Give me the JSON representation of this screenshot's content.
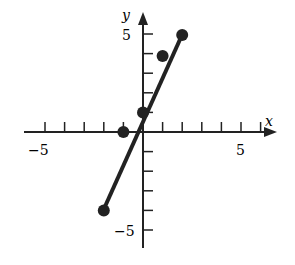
{
  "chart_data": {
    "type": "scatter",
    "title": "",
    "xlabel": "x",
    "ylabel": "y",
    "xlim": [
      -6,
      6.5
    ],
    "ylim": [
      -6,
      5.5
    ],
    "x_tick_labels": [
      "−5",
      "5"
    ],
    "y_tick_labels": [
      "5",
      "−5"
    ],
    "points": [
      {
        "x": -2,
        "y": -4
      },
      {
        "x": -1,
        "y": 0
      },
      {
        "x": 0,
        "y": 1
      },
      {
        "x": 1,
        "y": 4
      },
      {
        "x": 2,
        "y": 5
      }
    ],
    "line": {
      "from": [
        -2,
        -4
      ],
      "to": [
        2,
        5
      ]
    },
    "grid": false
  },
  "labels": {
    "x": "x",
    "y": "y",
    "xneg": "−5",
    "xpos": "5",
    "ypos": "5",
    "yneg": "−5"
  }
}
